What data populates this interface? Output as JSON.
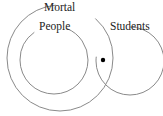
{
  "diagram": {
    "type": "euler-diagram",
    "sets": [
      {
        "name": "mortal",
        "label": "Mortal",
        "cx": 60,
        "cy": 58,
        "r": 53
      },
      {
        "name": "people",
        "label": "People",
        "cx": 54,
        "cy": 60,
        "r": 34
      },
      {
        "name": "students",
        "label": "Students",
        "cx": 130,
        "cy": 61,
        "r": 34
      }
    ],
    "point": {
      "cx": 103,
      "cy": 60,
      "r": 2.2,
      "region": "Mortal ∩ Students, outside People"
    },
    "colors": {
      "stroke": "#8a8a8a",
      "text": "#222222",
      "point": "#000000",
      "background": "#ffffff"
    }
  }
}
